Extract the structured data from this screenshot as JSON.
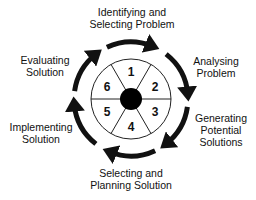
{
  "diagram": {
    "type": "cycle",
    "center": {
      "fill": "#000000"
    },
    "segments": [
      {
        "number": "1",
        "stage": "Identifying and Selecting Problem"
      },
      {
        "number": "2",
        "stage": "Analysing Problem"
      },
      {
        "number": "3",
        "stage": "Generating Potential Solutions"
      },
      {
        "number": "4",
        "stage": "Selecting and Planning Solution"
      },
      {
        "number": "5",
        "stage": "Implementing Solution"
      },
      {
        "number": "6",
        "stage": "Evaluating Solution"
      }
    ],
    "labels": {
      "top": {
        "line1": "Identifying and",
        "line2": "Selecting Problem"
      },
      "upper_right": {
        "line1": "Analysing",
        "line2": "Problem"
      },
      "lower_right": {
        "line1": "Generating",
        "line2": "Potential",
        "line3": "Solutions"
      },
      "bottom": {
        "line1": "Selecting and",
        "line2": "Planning Solution"
      },
      "lower_left": {
        "line1": "Implementing",
        "line2": "Solution"
      },
      "upper_left": {
        "line1": "Evaluating",
        "line2": "Solution"
      }
    },
    "arrow_direction": "clockwise",
    "colors": {
      "line": "#111111",
      "background": "#ffffff"
    }
  }
}
